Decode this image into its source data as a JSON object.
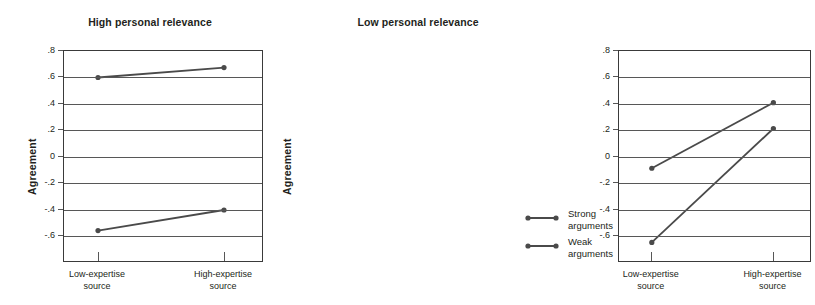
{
  "figure": {
    "width": 631,
    "height": 305,
    "background": "#ffffff",
    "line_color": "#4a4a4a",
    "grid_color": "#575757",
    "axis_color": "#3a3a3a",
    "text_color": "#231f20"
  },
  "chart_data": {
    "type": "line",
    "title": "",
    "xlabel": "",
    "ylabel": "Agreement",
    "ylim": [
      -0.8,
      0.8
    ],
    "ytick_labels": [
      ".8",
      ".6",
      ".4",
      ".2",
      "0",
      "-.2",
      "-.4",
      "-.6"
    ],
    "ytick_values": [
      0.8,
      0.6,
      0.4,
      0.2,
      0,
      -0.2,
      -0.4,
      -0.6
    ],
    "grid": true,
    "legend_position": "right",
    "categories": [
      "Low-expertise source",
      "High-expertise source"
    ],
    "category_lines": [
      [
        "Low-expertise",
        "source"
      ],
      [
        "High-expertise",
        "source"
      ]
    ],
    "legend": [
      "Strong arguments",
      "Weak arguments"
    ],
    "panels": [
      {
        "title": "High personal relevance",
        "ylabel": "Agreement",
        "series": [
          {
            "name": "Strong arguments",
            "values": [
              0.6,
              0.675
            ]
          },
          {
            "name": "Weak arguments",
            "values": [
              -0.555,
              -0.4
            ]
          }
        ]
      },
      {
        "title": "Low personal relevance",
        "ylabel": "Agreement",
        "series": [
          {
            "name": "Strong arguments",
            "values": [
              -0.085,
              0.41
            ]
          },
          {
            "name": "Weak arguments",
            "values": [
              -0.645,
              0.215
            ]
          }
        ]
      }
    ]
  },
  "legend": {
    "items": [
      {
        "label_line1": "Strong",
        "label_line2": "arguments"
      },
      {
        "label_line1": "Weak",
        "label_line2": "arguments"
      }
    ]
  }
}
